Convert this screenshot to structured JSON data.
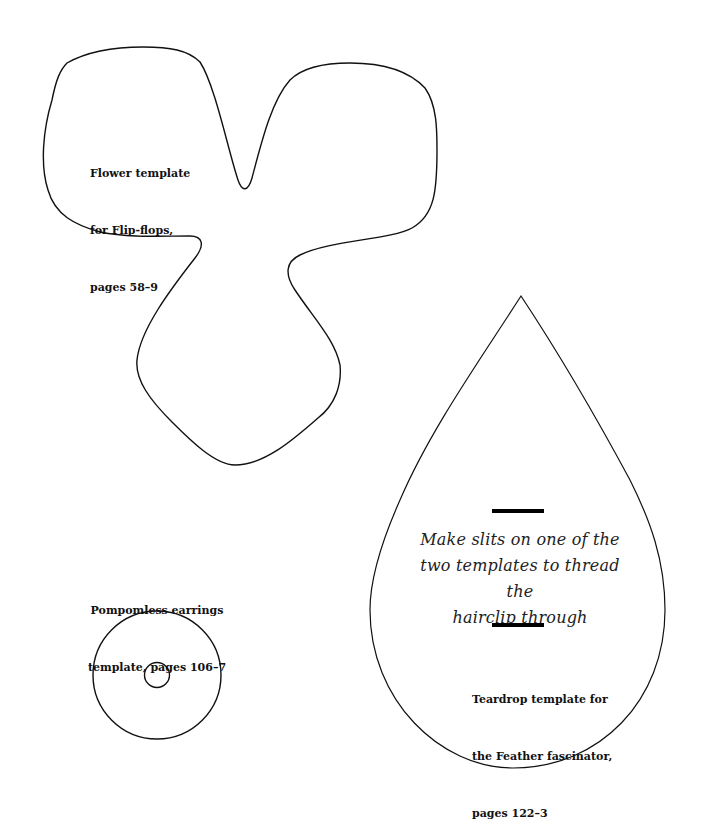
{
  "page": {
    "background": "#ffffff",
    "stroke_color": "#111111"
  },
  "flower_template": {
    "line1": "Flower template",
    "line2": "for Flip-flops,",
    "line3": "pages 58–9"
  },
  "earrings_template": {
    "line1": "Pompomless earrings",
    "line2": "template, pages 106–7"
  },
  "teardrop_template": {
    "instruction_line1": "Make slits on one of the",
    "instruction_line2": "two templates to thread the",
    "instruction_line3": "hairclip through",
    "line1": "Teardrop template for",
    "line2": "the Feather fascinator,",
    "line3": "pages 122–3"
  }
}
